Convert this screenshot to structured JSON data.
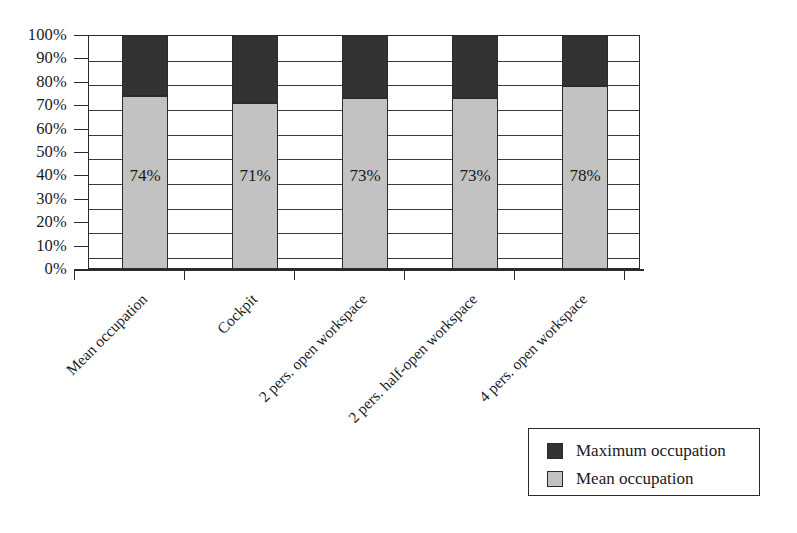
{
  "chart_data": {
    "type": "bar",
    "subtype": "stacked-column",
    "title": "",
    "xlabel": "",
    "ylabel": "",
    "ylim": [
      0,
      100
    ],
    "grid": true,
    "legend_position": "bottom-right",
    "categories": [
      "Mean occupation",
      "Cockpit",
      "2 pers. open workspace",
      "2 pers. half-open workspace",
      "4 pers. open workspace"
    ],
    "ytick_labels": [
      "100%",
      "90%",
      "80%",
      "70%",
      "60%",
      "50%",
      "40%",
      "30%",
      "20%",
      "10%",
      "0%"
    ],
    "ytick_values": [
      100,
      90,
      80,
      70,
      60,
      50,
      40,
      30,
      20,
      10,
      0
    ],
    "series": [
      {
        "name": "Mean occupation",
        "color": "#c2c2c2",
        "values": [
          74,
          71,
          73,
          73,
          78
        ],
        "data_labels": [
          "74%",
          "71%",
          "73%",
          "73%",
          "78%"
        ]
      },
      {
        "name": "Maximum occupation",
        "color": "#333333",
        "values": [
          26,
          29,
          27,
          27,
          22
        ],
        "cumulative_tops": [
          100,
          100,
          100,
          100,
          100
        ],
        "data_labels": [
          "",
          "",
          "",
          "",
          ""
        ]
      }
    ]
  },
  "legend": {
    "items": [
      {
        "label": "Maximum occupation",
        "color": "#333333"
      },
      {
        "label": "Mean occupation",
        "color": "#c2c2c2"
      }
    ]
  }
}
